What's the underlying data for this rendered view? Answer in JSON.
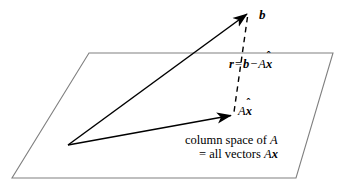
{
  "figure": {
    "background_color": "#ffffff",
    "plane_stroke_color": "#808080",
    "vector_stroke_color": "#000000",
    "labels": {
      "b": "b",
      "residual": {
        "vector_r": "r",
        "equals": "=",
        "vector_b": "b",
        "minus": "−",
        "matrix_A": "A",
        "x_hat_char": "x",
        "x_hat_mark": "ˆ"
      },
      "projection": {
        "matrix_A": "A",
        "x_hat_char": "x",
        "x_hat_mark": "ˆ"
      },
      "caption": {
        "line1_prefix": "column space of ",
        "line1_matrix": "A",
        "line2_prefix": "= all vectors ",
        "line2_matrix": "A",
        "line2_vector": "x"
      }
    },
    "geometry": {
      "plane_points": "89,53 333,53 296,178 12,178",
      "origin": {
        "x": 68,
        "y": 145
      },
      "b_tip": {
        "x": 248,
        "y": 13
      },
      "axhat_tip": {
        "x": 232,
        "y": 115
      },
      "dashed_from": {
        "x": 247,
        "y": 16
      },
      "dashed_to": {
        "x": 234,
        "y": 112
      }
    }
  }
}
